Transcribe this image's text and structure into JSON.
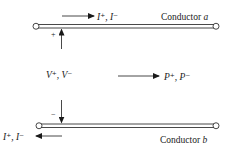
{
  "diagram": {
    "type": "transmission-line",
    "conductor_a": {
      "label": "Conductor",
      "letter": "a"
    },
    "conductor_b": {
      "label": "Conductor",
      "letter": "b"
    },
    "current_top": {
      "label": "I⁺, I⁻",
      "direction": "right"
    },
    "current_bottom": {
      "label": "I⁺, I⁻",
      "direction": "left"
    },
    "voltage": {
      "label": "V⁺, V⁻",
      "plus": "+",
      "minus": "−"
    },
    "power": {
      "label": "P⁺, P⁻",
      "direction": "right"
    },
    "colors": {
      "line": "#1a1a1a",
      "background": "#ffffff"
    }
  }
}
